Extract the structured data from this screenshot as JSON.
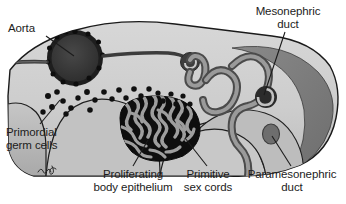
{
  "figure": {
    "type": "anatomical-illustration",
    "width": 346,
    "height": 204,
    "background_color": "#ffffff"
  },
  "labels": [
    {
      "id": "aorta",
      "text": "Aorta",
      "x": 8,
      "y": 22,
      "align": "left",
      "leader": {
        "x1": 46,
        "y1": 36,
        "x2": 74,
        "y2": 56
      }
    },
    {
      "id": "mesonephric-duct",
      "text": "Mesonephric\nduct",
      "x": 243,
      "y": 5,
      "align": "center",
      "leader": {
        "x1": 285,
        "y1": 32,
        "x2": 264,
        "y2": 95
      }
    },
    {
      "id": "primordial-germ-cells",
      "text": "Primordial\ngerm cells",
      "x": 6,
      "y": 126,
      "align": "left",
      "leader": {
        "x1": 40,
        "y1": 124,
        "x2": 60,
        "y2": 100
      }
    },
    {
      "id": "proliferating-body-epithelium",
      "text": "Proliferating\nbody epithelium",
      "x": 88,
      "y": 168,
      "align": "center",
      "leader": {
        "x1": 133,
        "y1": 166,
        "x2": 148,
        "y2": 140
      }
    },
    {
      "id": "primitive-sex-cords",
      "text": "Primitive\nsex cords",
      "x": 186,
      "y": 168,
      "align": "center",
      "leader": {
        "x1": 207,
        "y1": 166,
        "x2": 185,
        "y2": 138
      }
    },
    {
      "id": "paramesonephric-duct",
      "text": "Paramesonephric\nduct",
      "x": 243,
      "y": 168,
      "align": "center",
      "leader": {
        "x1": 291,
        "y1": 166,
        "x2": 272,
        "y2": 136
      }
    }
  ],
  "structures": [
    {
      "id": "body-outline",
      "name": "embryo body wall outline",
      "fill": "#cfcfcf",
      "stroke": "#1c1c1c"
    },
    {
      "id": "aorta-lumen",
      "name": "dorsal aorta lumen",
      "fill": "#3a3a3a"
    },
    {
      "id": "aorta-wall",
      "name": "dorsal aorta wall with endothelial nuclei",
      "fill": "#2a2a2a"
    },
    {
      "id": "mesonephric-tubule",
      "name": "mesonephric tubule",
      "fill": "#8e8e8e",
      "stroke": "#4d4d4d"
    },
    {
      "id": "glomerulus",
      "name": "renal corpuscle / glomerulus",
      "fill": "#2e2e2e"
    },
    {
      "id": "mesonephric-duct-lumen",
      "name": "mesonephric duct cross-section",
      "fill": "#2b2b2b"
    },
    {
      "id": "mesonephric-crescent",
      "name": "mesonephros crescent",
      "fill": "#7d7d7d"
    },
    {
      "id": "paramesonephric-duct-lumen",
      "name": "paramesonephric duct cross-section",
      "fill": "#6f6f6f"
    },
    {
      "id": "gonadal-ridge",
      "name": "gonadal ridge with primitive sex cords",
      "fill": "#111111"
    },
    {
      "id": "sex-cord-strands",
      "name": "primitive sex cord strands",
      "fill": "#9a9a9a"
    },
    {
      "id": "germ-cells",
      "name": "primordial germ cells",
      "fill": "#121212"
    },
    {
      "id": "gut",
      "name": "hindgut / dorsal mesentery",
      "fill": "#b4b4b4"
    }
  ],
  "artist_signature": {
    "id": "artist-signature",
    "text": "",
    "x": 37,
    "y": 170
  }
}
